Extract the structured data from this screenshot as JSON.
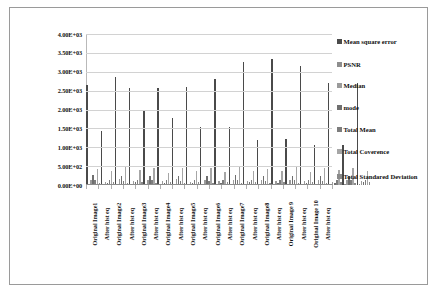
{
  "chart_data": {
    "type": "bar",
    "title": "",
    "xlabel": "",
    "ylabel": "",
    "ylim": [
      0,
      4000
    ],
    "grid": true,
    "legend_position": "right",
    "ytick_labels": [
      "4.00E+03",
      "3.50E+03",
      "3.00E+03",
      "2.50E+03",
      "2.00E+03",
      "1.50E+03",
      "1.00E+03",
      "5.00E+02",
      "0.00E+00"
    ],
    "ytick_values": [
      4000,
      3500,
      3000,
      2500,
      2000,
      1500,
      1000,
      500,
      0
    ],
    "categories": [
      "Original Image1",
      "After hist eq",
      "Original Image2",
      "After hist eq",
      "Original Image3",
      "After hist eq",
      "Original Image4",
      "After hist eq",
      "Original Image5",
      "After hist eq",
      "Original Image6",
      "After hist eq",
      "Original Image7",
      "After hist eq",
      "Original Image8",
      "After hist eq",
      "Original Image 9",
      "After hist eq",
      "Original Image 10",
      "After hist eq"
    ],
    "series": [
      {
        "name": "Mean square error",
        "values": [
          2660,
          1430,
          2850,
          2570,
          1960,
          2580,
          1780,
          2600,
          1550,
          2800,
          1550,
          3250,
          1200,
          3350,
          1230,
          3150,
          1050,
          2700,
          1060,
          2700
        ]
      },
      {
        "name": "PSNR",
        "values": [
          28,
          26,
          30,
          27,
          25,
          29,
          24,
          28,
          23,
          29,
          24,
          31,
          22,
          31,
          23,
          30,
          22,
          28,
          22,
          28
        ]
      },
      {
        "name": "Median",
        "values": [
          120,
          80,
          160,
          100,
          140,
          110,
          150,
          90,
          130,
          95,
          145,
          105,
          125,
          115,
          135,
          100,
          140,
          90,
          130,
          110
        ]
      },
      {
        "name": "mode",
        "values": [
          255,
          60,
          250,
          70,
          240,
          65,
          245,
          55,
          250,
          60,
          255,
          70,
          240,
          65,
          250,
          60,
          245,
          55,
          250,
          70
        ]
      },
      {
        "name": "Total Mean",
        "values": [
          120,
          128,
          118,
          127,
          122,
          129,
          116,
          126,
          119,
          128,
          121,
          127,
          117,
          129,
          120,
          126,
          118,
          128,
          122,
          127
        ]
      },
      {
        "name": "Total Coverence",
        "values": [
          430,
          360,
          470,
          390,
          440,
          330,
          460,
          370,
          450,
          340,
          480,
          380,
          420,
          360,
          470,
          350,
          440,
          390,
          460,
          370
        ]
      },
      {
        "name": "Total Standared Deviation",
        "values": [
          62,
          74,
          58,
          71,
          64,
          76,
          56,
          70,
          60,
          73,
          66,
          75,
          57,
          72,
          63,
          74,
          59,
          71,
          65,
          73
        ]
      }
    ]
  },
  "legend": {
    "items": [
      "Mean square error",
      "PSNR",
      "Median",
      "mode",
      "Total Mean",
      "Total Coverence",
      "Total Standared Deviation"
    ]
  }
}
